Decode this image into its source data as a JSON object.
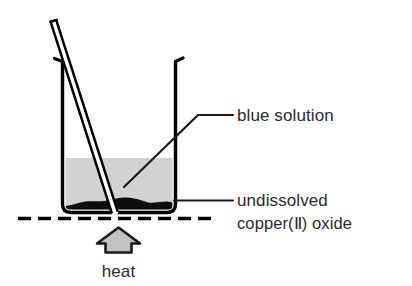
{
  "diagram": {
    "labels": {
      "blue_solution": "blue solution",
      "undissolved_line1": "undissolved",
      "undissolved_line2": "copper(Ⅱ) oxide",
      "heat": "heat"
    },
    "colors": {
      "outline": "#000000",
      "solution_fill": "#d2d2d2",
      "precipitate_fill": "#0d0d0d",
      "heat_arrow_fill": "#c2c2c2",
      "text": "#2b2b2b",
      "leader_line": "#1a1a1a",
      "background": "#ffffff"
    },
    "parts": {
      "beaker": "beaker-vessel",
      "stirring_rod": "glass-stirring-rod",
      "liquid": "blue-copper-sulfate-solution",
      "solid": "undissolved-copper-ii-oxide",
      "heat_source": "heat-arrow",
      "bench_line": "dashed-support-line"
    },
    "geometry": {
      "beaker_left_x": 62,
      "beaker_right_x": 176,
      "beaker_rim_y": 57,
      "beaker_base_y": 212,
      "liquid_surface_y": 158,
      "dashed_line_y": 218,
      "dashed_line_start_x": 18,
      "dashed_line_end_x": 218
    }
  }
}
